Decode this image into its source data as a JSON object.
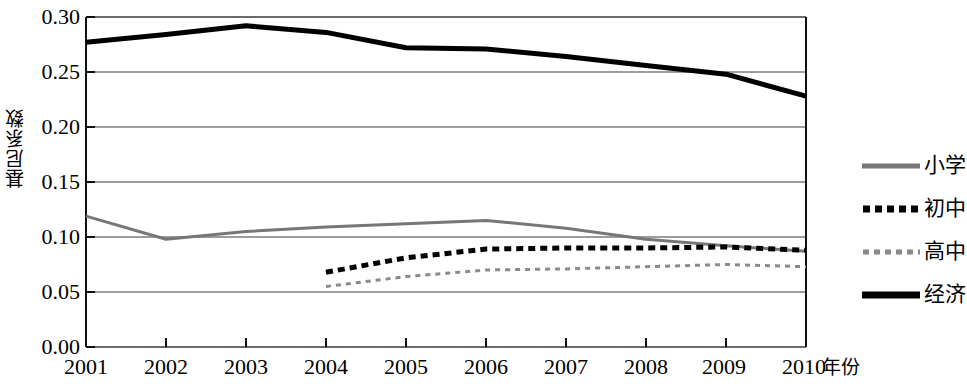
{
  "chart_data": {
    "type": "line",
    "title": "",
    "xlabel": "年份",
    "ylabel": "基尼系数",
    "x": [
      2001,
      2002,
      2003,
      2004,
      2005,
      2006,
      2007,
      2008,
      2009,
      2010
    ],
    "xticklabels": [
      "2001",
      "2002",
      "2003",
      "2004",
      "2005",
      "2006",
      "2007",
      "2008",
      "2009",
      "2010"
    ],
    "yticklabels": [
      "0.30",
      "0.25",
      "0.20",
      "0.15",
      "0.10",
      "0.05",
      "0.00"
    ],
    "ytickvalues": [
      0.3,
      0.25,
      0.2,
      0.15,
      0.1,
      0.05,
      0.0
    ],
    "ylim": [
      0.0,
      0.3
    ],
    "xlim": [
      2001,
      2010
    ],
    "grid": "horizontal",
    "legend_position": "right",
    "series": [
      {
        "name": "小学",
        "style": "solid",
        "color": "#777777",
        "width": 3,
        "x": [
          2001,
          2002,
          2003,
          2004,
          2005,
          2006,
          2007,
          2008,
          2009,
          2010
        ],
        "values": [
          0.119,
          0.098,
          0.105,
          0.109,
          0.112,
          0.115,
          0.108,
          0.098,
          0.092,
          0.087
        ]
      },
      {
        "name": "初中",
        "style": "dashed",
        "color": "#000000",
        "width": 5,
        "x": [
          2004,
          2005,
          2006,
          2007,
          2008,
          2009,
          2010
        ],
        "values": [
          0.068,
          0.081,
          0.089,
          0.09,
          0.09,
          0.091,
          0.088
        ]
      },
      {
        "name": "高中",
        "style": "dotted",
        "color": "#8a8a8a",
        "width": 3,
        "x": [
          2004,
          2005,
          2006,
          2007,
          2008,
          2009,
          2010
        ],
        "values": [
          0.055,
          0.064,
          0.07,
          0.071,
          0.073,
          0.075,
          0.073
        ]
      },
      {
        "name": "经济",
        "style": "solid",
        "color": "#000000",
        "width": 5,
        "x": [
          2001,
          2002,
          2003,
          2004,
          2005,
          2006,
          2007,
          2008,
          2009,
          2010
        ],
        "values": [
          0.277,
          0.284,
          0.292,
          0.286,
          0.272,
          0.271,
          0.264,
          0.256,
          0.248,
          0.228
        ]
      }
    ]
  },
  "axes": {
    "y_title": "基尼系数",
    "x_title": "年份",
    "y_ticks": [
      "0.30",
      "0.25",
      "0.20",
      "0.15",
      "0.10",
      "0.05",
      "0.00"
    ],
    "x_ticks": [
      "2001",
      "2002",
      "2003",
      "2004",
      "2005",
      "2006",
      "2007",
      "2008",
      "2009",
      "2010"
    ]
  },
  "legend": {
    "items": [
      {
        "label": "小学",
        "swatch": "gray-solid-line"
      },
      {
        "label": "初中",
        "swatch": "black-dashed-line"
      },
      {
        "label": "高中",
        "swatch": "gray-dotted-line"
      },
      {
        "label": "经济",
        "swatch": "black-solid-line"
      }
    ]
  }
}
